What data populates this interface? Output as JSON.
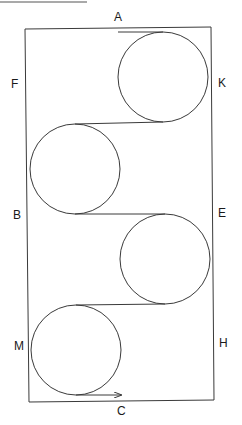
{
  "diagram": {
    "labels": {
      "top": "A",
      "left_upper": "F",
      "right_upper": "K",
      "left_middle": "B",
      "right_middle": "E",
      "left_lower": "M",
      "right_lower": "H",
      "bottom": "C"
    },
    "pulleys": [
      {
        "id": "pulley-1",
        "side": "right"
      },
      {
        "id": "pulley-2",
        "side": "left"
      },
      {
        "id": "pulley-3",
        "side": "right"
      },
      {
        "id": "pulley-4",
        "side": "left"
      }
    ],
    "arrow_direction": "right",
    "colors": {
      "line": "#3a3a3a",
      "text": "#1a1a1a",
      "background": "#ffffff"
    }
  }
}
